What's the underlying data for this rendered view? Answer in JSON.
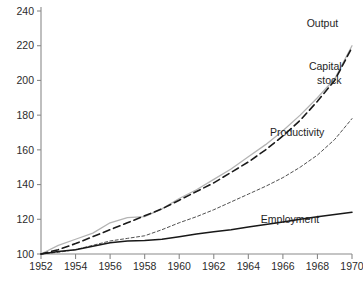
{
  "chart_data": {
    "type": "line",
    "title": "",
    "subtitle": "",
    "xlabel": "",
    "ylabel": "",
    "xlim": [
      1952,
      1970
    ],
    "ylim": [
      100,
      240
    ],
    "grid": false,
    "legend_position": "inline-right-of-curves",
    "index_base": "1952 = 100",
    "x": [
      1952,
      1953,
      1954,
      1955,
      1956,
      1957,
      1958,
      1959,
      1960,
      1961,
      1962,
      1963,
      1964,
      1965,
      1966,
      1967,
      1968,
      1969,
      1970
    ],
    "xticks": [
      "1952",
      "1954",
      "1956",
      "1958",
      "1960",
      "1962",
      "1964",
      "1966",
      "1968",
      "1970"
    ],
    "yticks": [
      "100",
      "120",
      "140",
      "160",
      "180",
      "200",
      "220",
      "240"
    ],
    "series": [
      {
        "name": "Output",
        "style": "solid",
        "color": "#b4b4b4",
        "width": 1.3,
        "values": [
          100,
          105,
          108.5,
          112,
          118,
          121,
          121.5,
          126,
          132,
          137,
          143,
          149,
          156,
          163,
          171,
          180,
          190,
          201,
          220
        ]
      },
      {
        "name": "Capital stock",
        "style": "dashed",
        "color": "#1a1a1a",
        "width": 1.6,
        "values": [
          100,
          102.5,
          106,
          110,
          114,
          118,
          122,
          126,
          131,
          136,
          141,
          147,
          153,
          160,
          168,
          177,
          188,
          200,
          219
        ]
      },
      {
        "name": "Productivity",
        "style": "fine-dashed",
        "color": "#3c3c3c",
        "width": 0.9,
        "values": [
          100,
          101,
          102.5,
          105,
          107.5,
          109,
          110.5,
          114,
          118,
          121.5,
          125.5,
          130,
          134.5,
          139,
          144,
          150,
          157,
          166,
          178
        ]
      },
      {
        "name": "Employment",
        "style": "solid",
        "color": "#181818",
        "width": 1.5,
        "values": [
          100,
          101.5,
          102.5,
          104.5,
          106.5,
          107.5,
          107.8,
          108.5,
          110,
          111.5,
          112.8,
          114,
          115.5,
          117,
          118.5,
          120,
          121.5,
          122.8,
          124
        ]
      }
    ],
    "annotations": [
      {
        "text": "Output",
        "x": 1969.2,
        "y": 231
      },
      {
        "text": "Capital",
        "x": 1969.4,
        "y": 206
      },
      {
        "text": "stock",
        "x": 1969.4,
        "y": 198
      },
      {
        "text": "Productivity",
        "x": 1968.4,
        "y": 168
      },
      {
        "text": "Employment",
        "x": 1968.1,
        "y": 118
      }
    ],
    "colors": {
      "axis": "#8a8a8a",
      "text": "#2b2b2b",
      "output": "#b4b4b4",
      "capital_stock": "#1a1a1a",
      "productivity": "#3c3c3c",
      "employment": "#181818",
      "background": "#ffffff"
    }
  }
}
